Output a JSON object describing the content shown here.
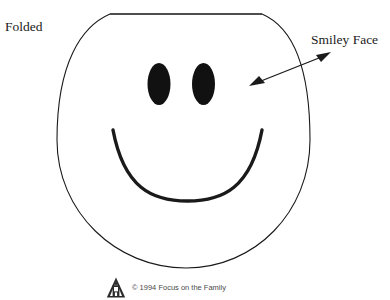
{
  "page": {
    "background_color": "#ffffff",
    "ink_color": "#1a1a1a"
  },
  "annotations": {
    "folded_label": "Folded",
    "smiley_label": "Smiley Face"
  },
  "figure": {
    "name": "smiley-face-craft-template",
    "face_outline_color": "#1a1a1a",
    "eye_fill_color": "#111111",
    "mouth_color": "#1a1a1a",
    "fold_line_color": "#3a3a3a",
    "arrow_color": "#1a1a1a"
  },
  "footer": {
    "copyright": "© 1994 Focus on the Family",
    "logo_name": "focus-on-the-family-logo",
    "logo_color": "#2b2b2b"
  }
}
